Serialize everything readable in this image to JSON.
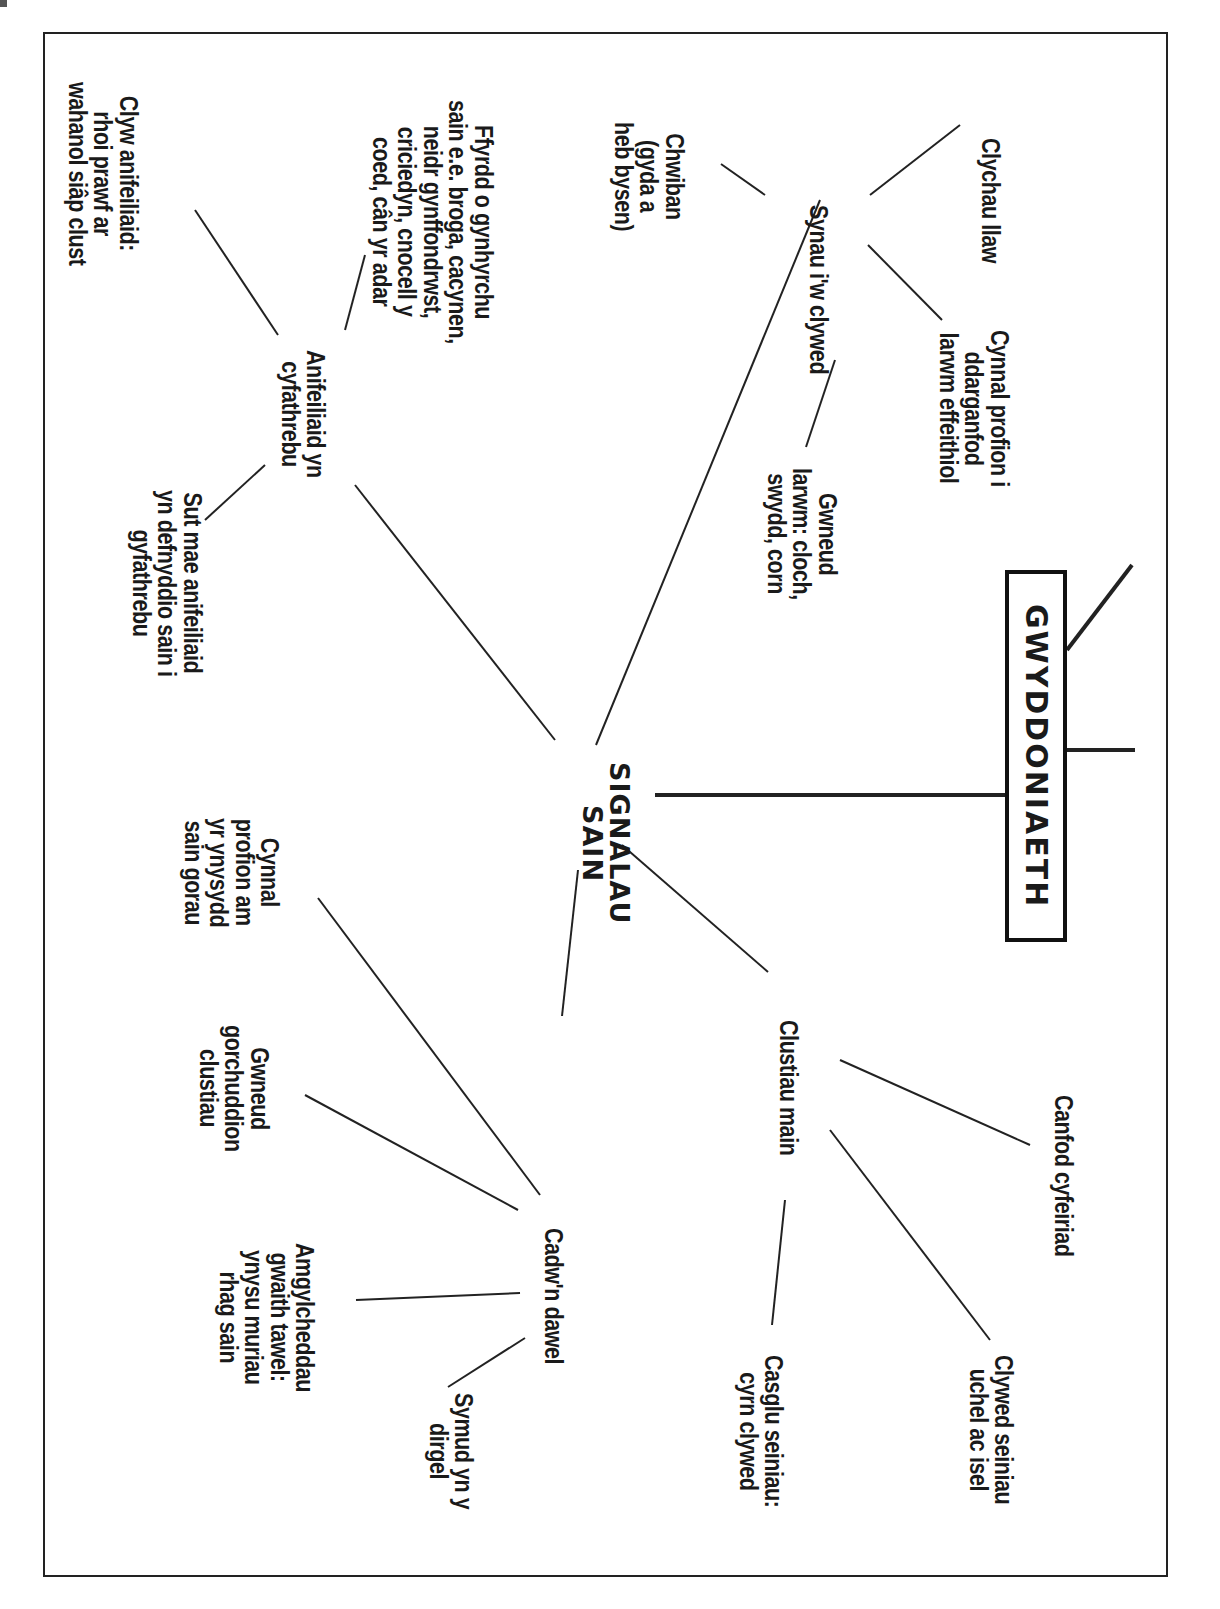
{
  "title": "GWYDDONIAETH",
  "center": "SIGNALAU\nSAIN",
  "branches": {
    "synau": {
      "label": "Synau i'w clywed",
      "children": [
        "Clychau llaw",
        "Cynnal profion i\nddarganfod\nlarwm effeithiol",
        "Gwneud\nlarwm: cloch,\nswydd, corn",
        "Chwiban\n(gyda a\nheb bysen)"
      ]
    },
    "anifeiliaid": {
      "label": "Anifeiliaid yn\ncyfathrebu",
      "children": [
        "Ffyrdd o gynhyrchu\nsain e.e. broga, cacynen,\nneidr gynffondrwst,\ncriciedyn, cnocell y\ncoed, cân yr adar",
        "Clyw anifeiliaid:\nrhoi prawf ar\nwahanol siâp clust",
        "Sut mae anifeiliaid\nyn defnyddio sain i\ngyfathrebu"
      ]
    },
    "clustiau": {
      "label": "Clustiau main",
      "children": [
        "Canfod cyfeiriad",
        "Clywed seiniau\nuchel ac isel",
        "Casglu seiniau:\ncyrn clywed"
      ]
    },
    "cadwn": {
      "label": "Cadw'n dawel",
      "children": [
        "Cynnal\nprofion am\nyr ynysydd\nsain gorau",
        "Gwneud\ngorchuddion\nclustiau",
        "Amgylcheddau\ngwaith tawel:\nynysu muriau\nrhag sain",
        "Symud yn y\ndirgel"
      ]
    }
  },
  "colors": {
    "ink": "#1a1a1a",
    "background": "#ffffff"
  }
}
